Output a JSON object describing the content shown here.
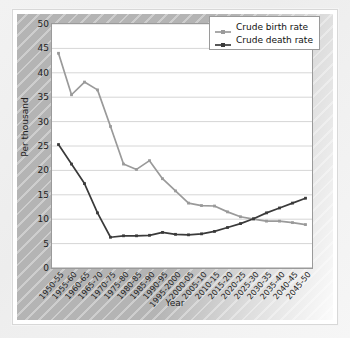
{
  "chart_data": {
    "type": "line",
    "title": "",
    "xlabel": "Year",
    "ylabel": "Per thousand",
    "ylim": [
      0,
      50
    ],
    "ytick_step": 5,
    "yticks": [
      0,
      5,
      10,
      15,
      20,
      25,
      30,
      35,
      40,
      45,
      50
    ],
    "grid": true,
    "legend_position": "top-right",
    "categories": [
      "1950-55",
      "1955-60",
      "1960-65",
      "1965-70",
      "1970-75",
      "1975-80",
      "1980-85",
      "1985-90",
      "1990-95",
      "1995-2000",
      "2000-05",
      "2005-10",
      "2010-15",
      "2015-20",
      "2020-25",
      "2025-30",
      "2030-35",
      "2035-40",
      "2040-45",
      "2045-50"
    ],
    "series": [
      {
        "name": "Crude birth rate",
        "color": "#9a9a9a",
        "values": [
          44.0,
          35.5,
          38.1,
          36.5,
          29.0,
          21.3,
          20.2,
          22.0,
          18.3,
          15.8,
          13.3,
          12.8,
          12.7,
          11.5,
          10.5,
          10.0,
          9.6,
          9.6,
          9.3,
          8.9
        ]
      },
      {
        "name": "Crude death rate",
        "color": "#3a3a3a",
        "values": [
          25.3,
          21.3,
          17.3,
          11.3,
          6.3,
          6.6,
          6.6,
          6.7,
          7.3,
          6.9,
          6.8,
          7.0,
          7.5,
          8.3,
          9.1,
          10.1,
          11.3,
          12.3,
          13.3,
          14.3
        ]
      }
    ]
  },
  "legend": {
    "items": [
      {
        "label": "Crude birth rate",
        "color": "#9a9a9a"
      },
      {
        "label": "Crude death rate",
        "color": "#3a3a3a"
      }
    ]
  },
  "axes": {
    "y_title": "Per thousand",
    "x_title": "Year"
  }
}
